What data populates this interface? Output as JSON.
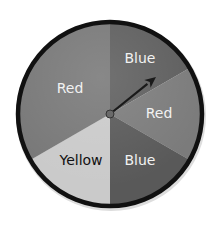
{
  "spinner": {
    "title": "Spinner",
    "center": [
      110,
      114
    ],
    "radius": 92,
    "rim_color": "#111111",
    "sectors": [
      {
        "label": "Blue",
        "start_deg": 0,
        "end_deg": 60,
        "fill": "#5e5e5e",
        "text_color": "#f2f2f2",
        "label_pos": [
          140,
          59
        ]
      },
      {
        "label": "Red",
        "start_deg": 60,
        "end_deg": 120,
        "fill": "#7b7b7b",
        "text_color": "#f2f2f2",
        "label_pos": [
          159,
          114
        ]
      },
      {
        "label": "Blue",
        "start_deg": 120,
        "end_deg": 180,
        "fill": "#595959",
        "text_color": "#f2f2f2",
        "label_pos": [
          140,
          161
        ]
      },
      {
        "label": "Yellow",
        "start_deg": 180,
        "end_deg": 240,
        "fill": "#cacaca",
        "text_color": "#111111",
        "label_pos": [
          81,
          161
        ]
      },
      {
        "label": "Red",
        "start_deg": 240,
        "end_deg": 360,
        "fill": "#787878",
        "text_color": "#f2f2f2",
        "label_pos": [
          70,
          89
        ]
      }
    ],
    "arrow": {
      "from": [
        110,
        114
      ],
      "to": [
        156,
        77
      ],
      "color": "#1a1a1a"
    }
  }
}
